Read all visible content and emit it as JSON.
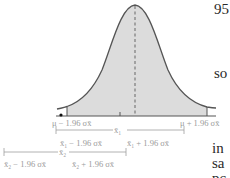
{
  "figure": {
    "labels": {
      "mu_minus": "μ − 1.96 σx̄",
      "mu_plus": "μ + 1.96 σx̄",
      "xbar1": "x̄₁",
      "xbar1_minus": "x̄₁ − 1.96 σx̄",
      "xbar1_plus": "x̄₁ + 1.96 σx̄",
      "xbar2": "x̄₂",
      "xbar2_minus": "x̄₂ − 1.96 σx̄",
      "xbar2_plus": "x̄₂ + 1.96 σx̄"
    },
    "colors": {
      "fill": "#dcdcdc",
      "curve": "#555555",
      "label": "#9a9a9a",
      "interval": "#a0a0a0"
    }
  },
  "side_text": {
    "top": "95",
    "middle": "so",
    "bottom_1": "in",
    "bottom_2": "sa",
    "bottom_3": "pc"
  }
}
